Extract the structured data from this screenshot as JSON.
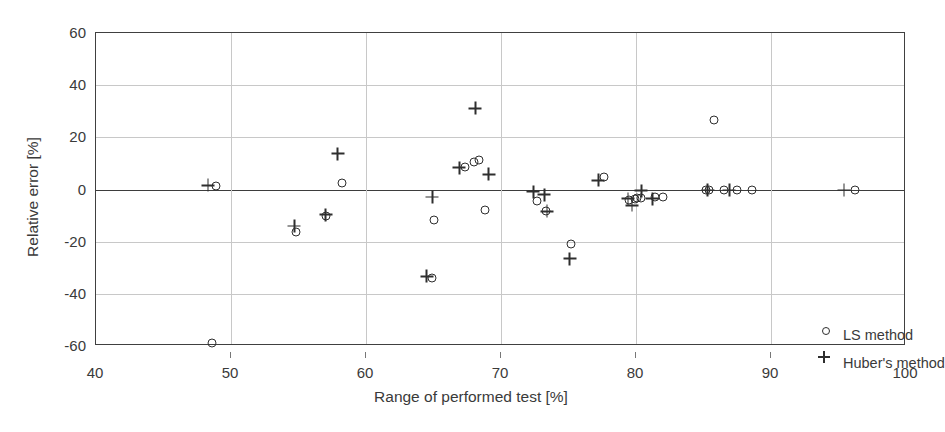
{
  "chart_data": {
    "type": "scatter",
    "title": "",
    "xlabel": "Range of performed test [%]",
    "ylabel": "Relative error [%]",
    "xlim": [
      40,
      100
    ],
    "ylim": [
      -60,
      60
    ],
    "xticks": [
      40,
      50,
      60,
      70,
      80,
      90,
      100
    ],
    "yticks": [
      -60,
      -40,
      -20,
      0,
      20,
      40,
      60
    ],
    "grid": true,
    "legend_position": "bottom-right",
    "zero_reference_line": 0,
    "marker_color": "#2e2e2e",
    "grid_color": "#c8c8c8",
    "axis_color": "#404040",
    "series": [
      {
        "name": "LS method",
        "marker": "circle",
        "points": [
          [
            48.6,
            -59.0
          ],
          [
            48.9,
            1.2
          ],
          [
            54.8,
            -16.3
          ],
          [
            57.0,
            -10.0
          ],
          [
            58.2,
            2.6
          ],
          [
            64.9,
            -33.8
          ],
          [
            65.0,
            -11.6
          ],
          [
            67.3,
            8.8
          ],
          [
            68.0,
            10.6
          ],
          [
            68.4,
            11.5
          ],
          [
            68.8,
            -7.8
          ],
          [
            72.7,
            -4.6
          ],
          [
            73.3,
            -8.2
          ],
          [
            75.2,
            -20.8
          ],
          [
            77.6,
            4.7
          ],
          [
            79.5,
            -4.1
          ],
          [
            79.9,
            -3.5
          ],
          [
            80.1,
            -3.3
          ],
          [
            80.4,
            -3.4
          ],
          [
            81.4,
            -3.0
          ],
          [
            82.0,
            -2.8
          ],
          [
            85.2,
            -0.2
          ],
          [
            85.4,
            -0.2
          ],
          [
            85.8,
            26.5
          ],
          [
            86.5,
            -0.2
          ],
          [
            87.5,
            -0.2
          ],
          [
            88.6,
            -0.2
          ],
          [
            96.2,
            -0.2
          ]
        ]
      },
      {
        "name": "Huber's method",
        "marker": "plus",
        "points": [
          [
            48.3,
            1.6
          ],
          [
            54.7,
            -14.0
          ],
          [
            57.0,
            -9.6
          ],
          [
            57.9,
            13.8
          ],
          [
            64.5,
            -33.3
          ],
          [
            64.9,
            -2.9
          ],
          [
            66.9,
            8.3
          ],
          [
            69.1,
            5.8
          ],
          [
            68.1,
            31.2
          ],
          [
            72.4,
            -0.8
          ],
          [
            73.2,
            -2.0
          ],
          [
            73.4,
            -8.4
          ],
          [
            75.1,
            -26.6
          ],
          [
            77.2,
            3.6
          ],
          [
            79.4,
            -3.6
          ],
          [
            79.7,
            -6.0
          ],
          [
            80.4,
            -0.4
          ],
          [
            81.2,
            -3.6
          ],
          [
            85.3,
            -0.2
          ],
          [
            86.9,
            -0.2
          ],
          [
            95.4,
            -0.2
          ]
        ]
      }
    ]
  },
  "legend": {
    "items": [
      {
        "label": "LS method",
        "marker": "circle"
      },
      {
        "label": "Huber's method",
        "marker": "plus"
      }
    ]
  }
}
